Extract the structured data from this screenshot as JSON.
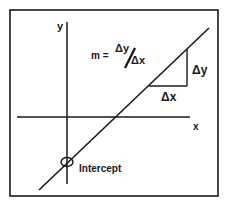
{
  "diagram": {
    "axes": {
      "x_label": "x",
      "y_label": "y"
    },
    "formula": {
      "lhs": "m =",
      "numerator": "Δy",
      "denominator": "Δx"
    },
    "triangle": {
      "rise_label": "Δy",
      "run_label": "Δx"
    },
    "intercept_label": "Intercept",
    "colors": {
      "stroke": "#1a1a1a",
      "background": "#ffffff"
    }
  }
}
